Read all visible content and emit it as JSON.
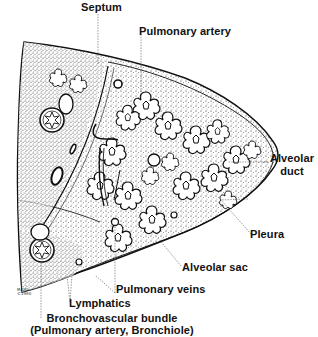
{
  "figure": {
    "ink_color": "#111111",
    "background_color": "#ffffff"
  },
  "labels": {
    "septum": "Septum",
    "pulmonary_artery": "Pulmonary artery",
    "alveolar_duct_line1": "Alveolar",
    "alveolar_duct_line2": "duct",
    "pleura": "Pleura",
    "alveolar_sac": "Alveolar sac",
    "pulmonary_veins": "Pulmonary veins",
    "lymphatics": "Lymphatics",
    "bronchovascular_line1": "Bronchovascular bundle",
    "bronchovascular_line2": "(Pulmonary artery, Bronchiole)"
  },
  "copyright_mark": {
    "line1": "MAYO",
    "line2": "©1990"
  }
}
